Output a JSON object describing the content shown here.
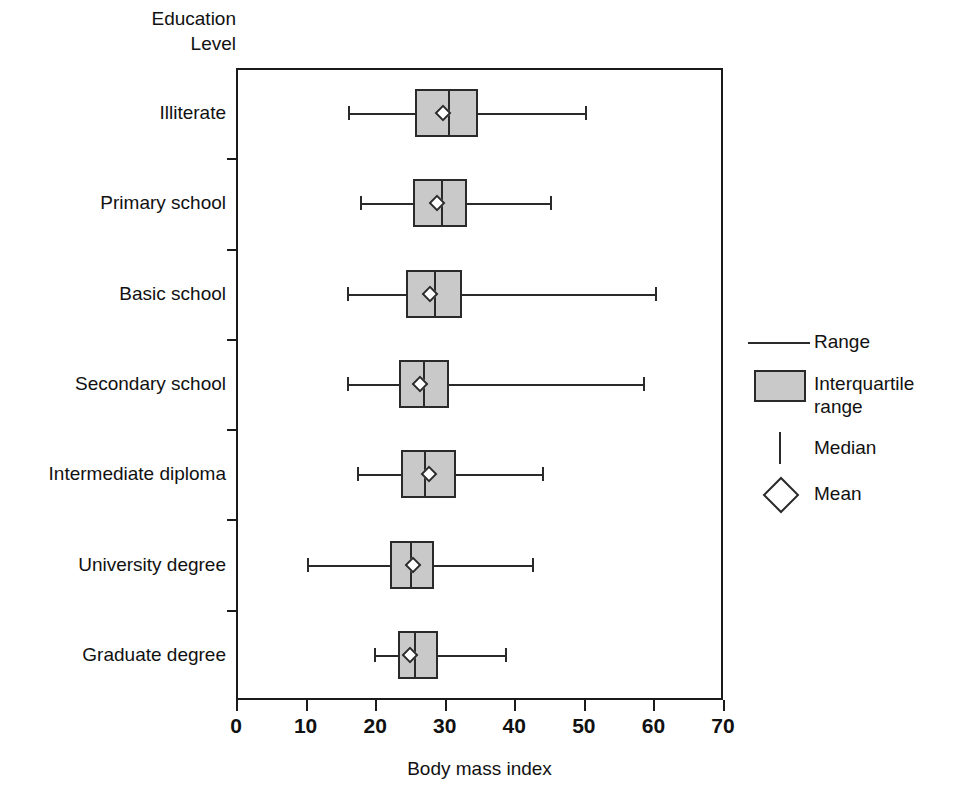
{
  "chart_data": {
    "type": "box",
    "title": "",
    "xlabel": "Body mass index",
    "ylabel": "Education\nLevel",
    "xlim": [
      0,
      70
    ],
    "xticks": [
      0,
      10,
      20,
      30,
      40,
      50,
      60,
      70
    ],
    "grid": false,
    "orientation": "horizontal",
    "categories": [
      "Illiterate",
      "Primary school",
      "Basic school",
      "Secondary school",
      "Intermediate diploma",
      "University degree",
      "Graduate degree"
    ],
    "boxes": [
      {
        "category": "Illiterate",
        "min": 16.1,
        "q1": 25.7,
        "median": 30.5,
        "mean": 29.8,
        "q3": 34.8,
        "max": 50.1
      },
      {
        "category": "Primary school",
        "min": 17.8,
        "q1": 25.4,
        "median": 29.4,
        "mean": 28.9,
        "q3": 33.2,
        "max": 45.1
      },
      {
        "category": "Basic school",
        "min": 15.9,
        "q1": 24.4,
        "median": 28.4,
        "mean": 27.9,
        "q3": 32.5,
        "max": 60.2
      },
      {
        "category": "Secondary school",
        "min": 16.0,
        "q1": 23.4,
        "median": 26.9,
        "mean": 26.4,
        "q3": 30.6,
        "max": 58.5
      },
      {
        "category": "Intermediate diploma",
        "min": 17.4,
        "q1": 23.7,
        "median": 27.0,
        "mean": 27.8,
        "q3": 31.6,
        "max": 44.0
      },
      {
        "category": "University degree",
        "min": 10.2,
        "q1": 22.2,
        "median": 25.0,
        "mean": 25.5,
        "q3": 28.4,
        "max": 42.5
      },
      {
        "category": "Graduate degree",
        "min": 19.8,
        "q1": 23.3,
        "median": 25.6,
        "mean": 25.0,
        "q3": 29.0,
        "max": 38.6
      }
    ],
    "legend": {
      "position": "right",
      "entries": [
        {
          "key": "range-line",
          "label": "Range"
        },
        {
          "key": "iqr-box",
          "label": "Interquartile range"
        },
        {
          "key": "median-tick",
          "label": "Median"
        },
        {
          "key": "mean-marker",
          "label": "Mean"
        }
      ]
    },
    "colors": {
      "box_fill": "#c9c9c9",
      "line": "#2a2a2a",
      "axis": "#1b1b1b",
      "text": "#111111",
      "background": "#ffffff"
    }
  }
}
